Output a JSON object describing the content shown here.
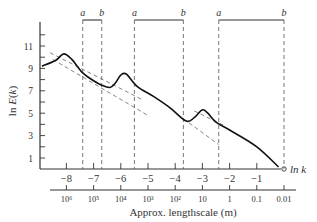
{
  "chart_data": {
    "type": "line",
    "title": "",
    "xlabel": "ln k",
    "secondary_xlabel": "Approx. lengthscale (m)",
    "ylabel": "ln E(k)",
    "xlim": [
      -9,
      0.5
    ],
    "ylim": [
      0,
      12.5
    ],
    "x_ticks": [
      -8,
      -7,
      -6,
      -5,
      -4,
      -3,
      -2,
      -1,
      0
    ],
    "x_tick_labels": [
      "−8",
      "−7",
      "−6",
      "−5",
      "−4",
      "−3",
      "−2",
      "−1",
      "0"
    ],
    "y_ticks": [
      1,
      3,
      5,
      7,
      9,
      11
    ],
    "y_tick_labels": [
      "1",
      "3",
      "5",
      "7",
      "9",
      "11"
    ],
    "lengthscale_ticks": [
      -8,
      -7,
      -6,
      -5,
      -4,
      -3,
      -2,
      -1,
      0
    ],
    "lengthscale_labels": [
      "10⁶",
      "10⁵",
      "10⁴",
      "10³",
      "10²",
      "10",
      "1",
      "0.1",
      "0.01"
    ],
    "grid": false,
    "series": [
      {
        "name": "energy spectrum",
        "x": [
          -8.9,
          -8.4,
          -8.1,
          -7.8,
          -7.4,
          -7.0,
          -6.7,
          -6.4,
          -6.2,
          -6.0,
          -5.8,
          -5.4,
          -4.8,
          -4.2,
          -3.6,
          -3.3,
          -3.0,
          -2.8,
          -2.5,
          -2.0,
          -1.0,
          -0.2
        ],
        "values": [
          9.2,
          9.7,
          10.3,
          9.8,
          8.6,
          7.9,
          7.5,
          7.3,
          7.7,
          8.4,
          8.5,
          7.4,
          6.5,
          5.5,
          4.3,
          4.6,
          5.3,
          5.0,
          4.2,
          3.5,
          2.0,
          0.2
        ]
      }
    ],
    "reference_lines": [
      {
        "name": "dashed-upper-1",
        "x": [
          -8.6,
          -5.2
        ],
        "values": [
          10.4,
          6.2
        ]
      },
      {
        "name": "dashed-lower-1",
        "x": [
          -8.5,
          -5.0
        ],
        "values": [
          9.8,
          4.8
        ]
      },
      {
        "name": "dashed-upper-2",
        "x": [
          -3.3,
          -2.2
        ],
        "values": [
          5.2,
          3.9
        ]
      },
      {
        "name": "dashed-lower-2",
        "x": [
          -3.7,
          -2.4
        ],
        "values": [
          4.5,
          2.2
        ]
      }
    ],
    "bands": [
      {
        "a": -7.4,
        "b": -6.7
      },
      {
        "a": -5.5,
        "b": -3.7
      },
      {
        "a": -2.4,
        "b": 0
      }
    ],
    "band_labels": {
      "a": "a",
      "b": "b"
    }
  },
  "labels": {
    "x_axis": "ln k",
    "x_secondary": "Approx. lengthscale (m)",
    "y_axis": "ln E(k)",
    "a": "a",
    "b": "b"
  }
}
